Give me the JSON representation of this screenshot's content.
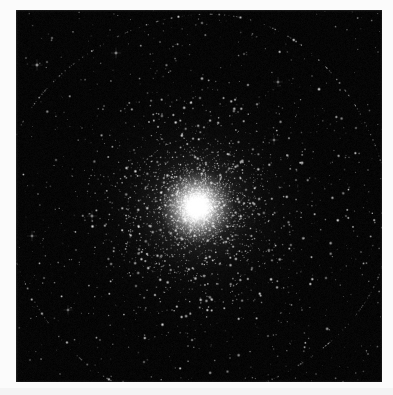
{
  "page": {
    "width": 393,
    "height": 395,
    "background_color": "#fbfbfb",
    "margin_tint_color": "#f4f4f4",
    "caption": ""
  },
  "photo": {
    "title": "Globular Star Cluster",
    "alt_text": "Dense spherical swarm of stars with a brilliant unresolved core fading into a sparse field of foreground stars on a black sky background",
    "frame": {
      "x": 16,
      "y": 10,
      "width": 366,
      "height": 372
    },
    "sky_color": "#000000",
    "star_color": "#ffffff",
    "core_color": "#ffffff",
    "halo_color": "#e8e8e8"
  },
  "chart_data": {
    "type": "scatter",
    "subtitle": "",
    "xlabel": "",
    "ylabel": "",
    "grid": false,
    "legend_position": "none",
    "xlim": [
      0,
      366
    ],
    "ylim": [
      0,
      372
    ],
    "cluster": {
      "center_x": 181,
      "center_y": 197,
      "core_radius": 16,
      "half_light_radius": 46,
      "halo_radius": 132,
      "tidal_radius": 190,
      "core_peak_brightness": 1.0,
      "star_count_core": 2600,
      "star_count_halo": 5200,
      "star_count_field": 420,
      "profile": "king",
      "concentration": 2.5
    },
    "field_stars": [
      {
        "x": 36,
        "y": 28,
        "mag": 0.55,
        "size": 1.6
      },
      {
        "x": 57,
        "y": 22,
        "mag": 0.4,
        "size": 1.3
      },
      {
        "x": 94,
        "y": 20,
        "mag": 0.35,
        "size": 1.2
      },
      {
        "x": 21,
        "y": 55,
        "mag": 0.72,
        "size": 2.1
      },
      {
        "x": 31,
        "y": 52,
        "mag": 0.5,
        "size": 1.5
      },
      {
        "x": 10,
        "y": 48,
        "mag": 0.42,
        "size": 1.4
      },
      {
        "x": 100,
        "y": 43,
        "mag": 0.68,
        "size": 2.0
      },
      {
        "x": 144,
        "y": 32,
        "mag": 0.46,
        "size": 1.4
      },
      {
        "x": 186,
        "y": 13,
        "mag": 0.58,
        "size": 1.7
      },
      {
        "x": 228,
        "y": 44,
        "mag": 0.48,
        "size": 1.5
      },
      {
        "x": 262,
        "y": 72,
        "mag": 0.62,
        "size": 1.9
      },
      {
        "x": 296,
        "y": 66,
        "mag": 0.38,
        "size": 1.3
      },
      {
        "x": 324,
        "y": 80,
        "mag": 0.44,
        "size": 1.4
      },
      {
        "x": 340,
        "y": 118,
        "mag": 0.52,
        "size": 1.6
      },
      {
        "x": 352,
        "y": 160,
        "mag": 0.4,
        "size": 1.3
      },
      {
        "x": 330,
        "y": 206,
        "mag": 0.47,
        "size": 1.5
      },
      {
        "x": 345,
        "y": 242,
        "mag": 0.43,
        "size": 1.4
      },
      {
        "x": 310,
        "y": 268,
        "mag": 0.56,
        "size": 1.7
      },
      {
        "x": 286,
        "y": 300,
        "mag": 0.41,
        "size": 1.3
      },
      {
        "x": 252,
        "y": 326,
        "mag": 0.5,
        "size": 1.5
      },
      {
        "x": 214,
        "y": 348,
        "mag": 0.39,
        "size": 1.3
      },
      {
        "x": 172,
        "y": 336,
        "mag": 0.46,
        "size": 1.4
      },
      {
        "x": 128,
        "y": 352,
        "mag": 0.53,
        "size": 1.6
      },
      {
        "x": 84,
        "y": 330,
        "mag": 0.44,
        "size": 1.4
      },
      {
        "x": 52,
        "y": 300,
        "mag": 0.6,
        "size": 1.8
      },
      {
        "x": 28,
        "y": 268,
        "mag": 0.49,
        "size": 1.5
      },
      {
        "x": 16,
        "y": 226,
        "mag": 0.64,
        "size": 1.9
      },
      {
        "x": 22,
        "y": 184,
        "mag": 0.45,
        "size": 1.4
      },
      {
        "x": 40,
        "y": 150,
        "mag": 0.52,
        "size": 1.6
      },
      {
        "x": 66,
        "y": 118,
        "mag": 0.37,
        "size": 1.2
      },
      {
        "x": 88,
        "y": 96,
        "mag": 0.42,
        "size": 1.4
      },
      {
        "x": 120,
        "y": 276,
        "mag": 0.58,
        "size": 1.7
      },
      {
        "x": 98,
        "y": 238,
        "mag": 0.51,
        "size": 1.5
      },
      {
        "x": 76,
        "y": 206,
        "mag": 0.66,
        "size": 2.0
      },
      {
        "x": 60,
        "y": 240,
        "mag": 0.43,
        "size": 1.4
      },
      {
        "x": 156,
        "y": 300,
        "mag": 0.4,
        "size": 1.3
      },
      {
        "x": 196,
        "y": 290,
        "mag": 0.47,
        "size": 1.5
      },
      {
        "x": 236,
        "y": 258,
        "mag": 0.54,
        "size": 1.6
      },
      {
        "x": 268,
        "y": 216,
        "mag": 0.45,
        "size": 1.4
      },
      {
        "x": 280,
        "y": 170,
        "mag": 0.49,
        "size": 1.5
      },
      {
        "x": 258,
        "y": 130,
        "mag": 0.61,
        "size": 1.8
      },
      {
        "x": 222,
        "y": 102,
        "mag": 0.44,
        "size": 1.4
      },
      {
        "x": 184,
        "y": 88,
        "mag": 0.57,
        "size": 1.7
      },
      {
        "x": 146,
        "y": 104,
        "mag": 0.41,
        "size": 1.3
      },
      {
        "x": 118,
        "y": 140,
        "mag": 0.48,
        "size": 1.5
      },
      {
        "x": 362,
        "y": 42,
        "mag": 0.36,
        "size": 1.2
      },
      {
        "x": 14,
        "y": 350,
        "mag": 0.42,
        "size": 1.4
      },
      {
        "x": 352,
        "y": 344,
        "mag": 0.45,
        "size": 1.4
      },
      {
        "x": 300,
        "y": 364,
        "mag": 0.38,
        "size": 1.2
      },
      {
        "x": 44,
        "y": 364,
        "mag": 0.4,
        "size": 1.3
      }
    ]
  }
}
